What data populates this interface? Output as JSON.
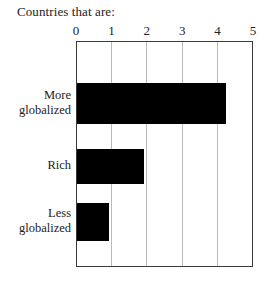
{
  "chart_data": {
    "type": "bar",
    "orientation": "horizontal",
    "title": "Countries that are:",
    "xlabel": "",
    "ylabel": "",
    "xlim": [
      0,
      5
    ],
    "grid": true,
    "legend": null,
    "xticks": [
      "0",
      "1",
      "2",
      "3",
      "4",
      "5"
    ],
    "xtick_values": [
      0,
      1,
      2,
      3,
      4,
      5
    ],
    "categories": [
      "More globalized",
      "Rich",
      "Less globalized"
    ],
    "category_lines": [
      [
        "More",
        "globalized"
      ],
      [
        "Rich"
      ],
      [
        "Less",
        "globalized"
      ]
    ],
    "values": [
      4.2,
      1.9,
      0.9
    ],
    "bar_color": "#000000",
    "frame_color": "#3a3a3a",
    "grid_color": "#b9b9b9",
    "background_color": "#ffffff"
  }
}
